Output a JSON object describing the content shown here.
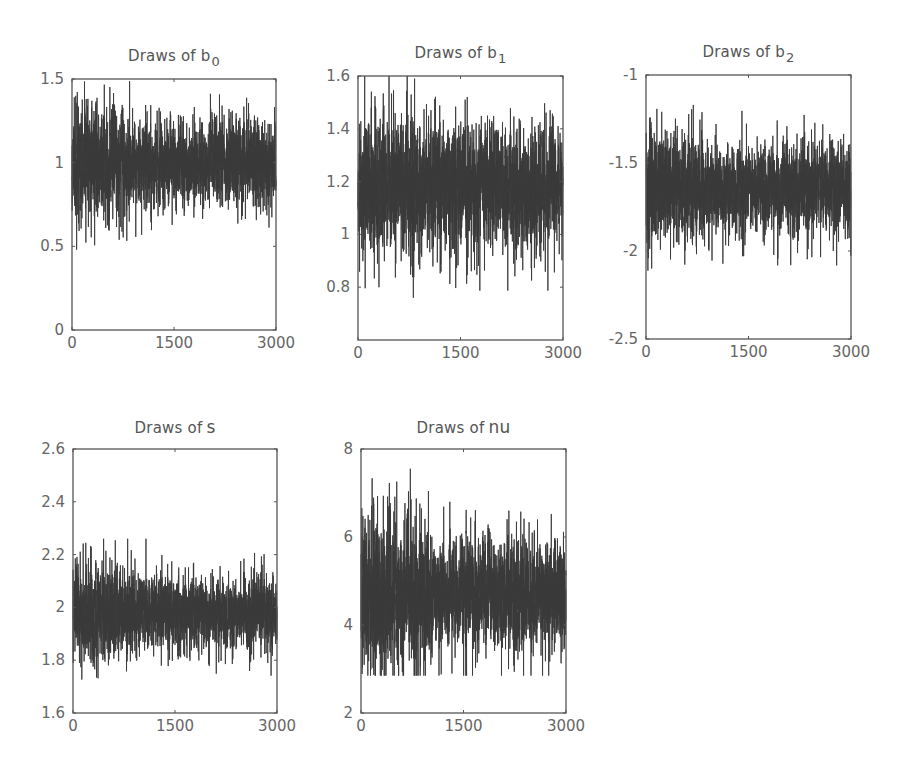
{
  "figure": {
    "background": "#ffffff",
    "trace_color": "#3a3a3a",
    "frame_color": "#555555"
  },
  "chart_data": [
    {
      "type": "line",
      "id": "b0",
      "title": "Draws of b",
      "title_subscript": "0",
      "xlabel": "",
      "ylabel": "",
      "xlim": [
        0,
        3000
      ],
      "ylim": [
        0,
        1.5
      ],
      "xticks": [
        0,
        1500,
        3000
      ],
      "xtick_labels": [
        "0",
        "1500",
        "3000"
      ],
      "yticks": [
        0,
        0.5,
        1,
        1.5
      ],
      "ytick_labels": [
        "0",
        "0.5",
        "1",
        "1.5"
      ],
      "grid": false,
      "n_draws": 3000,
      "series": [
        {
          "name": "b0 draws",
          "mean": 1.0,
          "band_low": 0.8,
          "band_high": 1.2,
          "min": 0.48,
          "max": 1.5,
          "burn_in_end": 850,
          "burn_in_spread": 0.16,
          "stationary_spread": 0.12
        }
      ],
      "box": {
        "left": 72,
        "top": 79,
        "right": 276,
        "bottom": 330
      }
    },
    {
      "type": "line",
      "id": "b1",
      "title": "Draws of b",
      "title_subscript": "1",
      "xlabel": "",
      "ylabel": "",
      "xlim": [
        0,
        3000
      ],
      "ylim": [
        0.6,
        1.6
      ],
      "xticks": [
        0,
        1500,
        3000
      ],
      "xtick_labels": [
        "0",
        "1500",
        "3000"
      ],
      "yticks": [
        0.8,
        1,
        1.2,
        1.4,
        1.6
      ],
      "ytick_labels": [
        "0.8",
        "1",
        "1.2",
        "1.4",
        "1.6"
      ],
      "grid": false,
      "n_draws": 3000,
      "series": [
        {
          "name": "b1 draws",
          "mean": 1.18,
          "band_low": 1.0,
          "band_high": 1.37,
          "min": 0.76,
          "max": 1.6,
          "burn_in_end": 850,
          "burn_in_spread": 0.13,
          "stationary_spread": 0.11
        }
      ],
      "box": {
        "left": 358,
        "top": 76,
        "right": 563,
        "bottom": 340
      }
    },
    {
      "type": "line",
      "id": "b2",
      "title": "Draws of b",
      "title_subscript": "2",
      "xlabel": "",
      "ylabel": "",
      "xlim": [
        0,
        3000
      ],
      "ylim": [
        -2.5,
        -1
      ],
      "xticks": [
        0,
        1500,
        3000
      ],
      "xtick_labels": [
        "0",
        "1500",
        "3000"
      ],
      "yticks": [
        -2.5,
        -2,
        -1.5,
        -1
      ],
      "ytick_labels": [
        "-2.5",
        "-2",
        "-1.5",
        "-1"
      ],
      "grid": false,
      "n_draws": 3000,
      "series": [
        {
          "name": "b2 draws",
          "mean": -1.65,
          "band_low": -1.85,
          "band_high": -1.43,
          "min": -2.13,
          "max": -1.17,
          "burn_in_end": 850,
          "burn_in_spread": 0.15,
          "stationary_spread": 0.12
        }
      ],
      "box": {
        "left": 646,
        "top": 75,
        "right": 851,
        "bottom": 339
      }
    },
    {
      "type": "line",
      "id": "s",
      "title": "Draws of",
      "title_symbol": "s",
      "xlabel": "",
      "ylabel": "",
      "xlim": [
        0,
        3000
      ],
      "ylim": [
        1.6,
        2.6
      ],
      "xticks": [
        0,
        1500,
        3000
      ],
      "xtick_labels": [
        "0",
        "1500",
        "3000"
      ],
      "yticks": [
        1.6,
        1.8,
        2,
        2.2,
        2.4,
        2.6
      ],
      "ytick_labels": [
        "1.6",
        "1.8",
        "2",
        "2.2",
        "2.4",
        "2.6"
      ],
      "grid": false,
      "n_draws": 3000,
      "series": [
        {
          "name": "s draws",
          "mean": 1.98,
          "band_low": 1.86,
          "band_high": 2.1,
          "min": 1.68,
          "max": 2.26,
          "burn_in_end": 900,
          "burn_in_spread": 0.09,
          "stationary_spread": 0.065
        }
      ],
      "box": {
        "left": 73,
        "top": 449,
        "right": 277,
        "bottom": 713
      }
    },
    {
      "type": "line",
      "id": "nu",
      "title": "Draws of",
      "title_symbol": "nu",
      "xlabel": "",
      "ylabel": "",
      "xlim": [
        0,
        3000
      ],
      "ylim": [
        2,
        8
      ],
      "xticks": [
        0,
        1500,
        3000
      ],
      "xtick_labels": [
        "0",
        "1500",
        "3000"
      ],
      "yticks": [
        2,
        4,
        6,
        8
      ],
      "ytick_labels": [
        "2",
        "4",
        "6",
        "8"
      ],
      "grid": false,
      "n_draws": 3000,
      "series": [
        {
          "name": "nu draws",
          "mean": 4.75,
          "band_low": 3.7,
          "band_high": 5.9,
          "min": 2.85,
          "max": 7.65,
          "burn_in_end": 1000,
          "burn_in_spread": 0.85,
          "stationary_spread": 0.6
        }
      ],
      "box": {
        "left": 361,
        "top": 449,
        "right": 566,
        "bottom": 713
      }
    }
  ]
}
